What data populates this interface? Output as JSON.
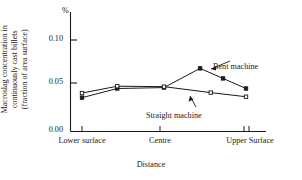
{
  "chart_data": {
    "type": "line",
    "title": "",
    "unit_symbol": "%",
    "xlabel": "Distance",
    "ylabel_lines": [
      "Macroslag concentration in",
      "continuously cast billets",
      "(fraction of area surface)"
    ],
    "ylabel": "Macroslag concentration in continuously cast billets (fraction of area surface)",
    "ylim": [
      0.0,
      0.115
    ],
    "ytick_values": [
      0.0,
      0.05,
      0.1
    ],
    "ytick_labels": [
      "0.00",
      "0.05",
      "0.10"
    ],
    "xlim": [
      0,
      1
    ],
    "xtick_positions": [
      0.0,
      0.5,
      1.0
    ],
    "xtick_labels": [
      "Lower surface",
      "Centre",
      "Upper Surface"
    ],
    "grid": false,
    "legend_position": "inline-annotation",
    "series": [
      {
        "name": "Bent machine",
        "marker": "filled-square",
        "color": "#1a1a1a",
        "x": [
          0.0,
          0.215,
          0.5,
          0.72,
          0.86,
          1.0
        ],
        "values": [
          0.037,
          0.047,
          0.048,
          0.069,
          0.058,
          0.047
        ]
      },
      {
        "name": "Straight machine",
        "marker": "open-square",
        "color": "#1a1a1a",
        "x": [
          0.0,
          0.215,
          0.5,
          0.785,
          1.0
        ],
        "values": [
          0.042,
          0.0495,
          0.049,
          0.0425,
          0.038
        ]
      }
    ],
    "annotations": [
      {
        "text": "Bent machine",
        "target_series": "Bent machine"
      },
      {
        "text": "Straight machine",
        "target_series": "Straight machine"
      }
    ]
  },
  "axis": {
    "tick_0": "0.00",
    "tick_1": "0.05",
    "tick_2": "0.10",
    "unit": "%",
    "x_0": "Lower surface",
    "x_1": "Centre",
    "x_2": "Upper Surface",
    "x_title": "Distance"
  },
  "ylabel": {
    "line0": "Macroslag concentration in",
    "line1": "continuously cast billets",
    "line2": "(fraction of area surface)"
  },
  "labels": {
    "bent": "Bent machine",
    "straight": "Straight machine"
  },
  "colors": {
    "axis": "#1a1a1a",
    "series_bent": "#1a1a1a",
    "series_straight": "#1a1a1a",
    "background": "#ffffff"
  }
}
